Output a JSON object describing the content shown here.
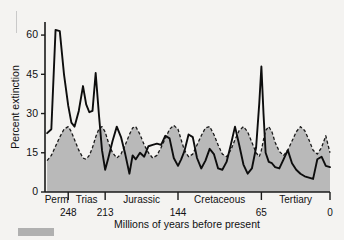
{
  "chart_data": {
    "type": "line",
    "title": "",
    "xlabel": "Millions of years before present",
    "ylabel": "Percent extinction",
    "xlim": [
      270,
      0
    ],
    "ylim": [
      0,
      65
    ],
    "yticks": [
      0,
      15,
      30,
      45,
      60
    ],
    "ytick_labels": [
      "0",
      "15",
      "30",
      "45",
      "60"
    ],
    "x_axis_direction": "reversed",
    "grid": false,
    "legend": "none",
    "period_boundaries": [
      248,
      213,
      144,
      65,
      0
    ],
    "boundary_labels": [
      "248",
      "213",
      "144",
      "65",
      "0"
    ],
    "periods": [
      {
        "label": "Perm",
        "start": 270,
        "end": 248
      },
      {
        "label": "Trias",
        "start": 248,
        "end": 213
      },
      {
        "label": "Jurassic",
        "start": 213,
        "end": 144
      },
      {
        "label": "Cretaceous",
        "start": 144,
        "end": 65
      },
      {
        "label": "Tertiary",
        "start": 65,
        "end": 0
      }
    ],
    "series": [
      {
        "name": "Observed percent extinction",
        "style": "solid",
        "color": "#0d0d0d",
        "points": [
          [
            268,
            22.5
          ],
          [
            264,
            24.0
          ],
          [
            260,
            62.0
          ],
          [
            256,
            61.5
          ],
          [
            252,
            45.0
          ],
          [
            248,
            33.0
          ],
          [
            245,
            26.5
          ],
          [
            242,
            25.0
          ],
          [
            238,
            31.0
          ],
          [
            234,
            40.5
          ],
          [
            231,
            33.5
          ],
          [
            228,
            30.5
          ],
          [
            225,
            31.0
          ],
          [
            222,
            45.5
          ],
          [
            219,
            30.0
          ],
          [
            216,
            16.0
          ],
          [
            213,
            8.5
          ],
          [
            210,
            13.0
          ],
          [
            206,
            19.5
          ],
          [
            202,
            25.0
          ],
          [
            198,
            21.0
          ],
          [
            194,
            14.5
          ],
          [
            190,
            7.0
          ],
          [
            187,
            14.0
          ],
          [
            184,
            12.5
          ],
          [
            180,
            15.0
          ],
          [
            176,
            13.5
          ],
          [
            172,
            17.5
          ],
          [
            168,
            18.0
          ],
          [
            164,
            18.5
          ],
          [
            160,
            18.0
          ],
          [
            156,
            21.5
          ],
          [
            152,
            20.5
          ],
          [
            148,
            13.0
          ],
          [
            144,
            10.0
          ],
          [
            141,
            12.5
          ],
          [
            138,
            15.5
          ],
          [
            134,
            22.0
          ],
          [
            130,
            21.0
          ],
          [
            126,
            13.0
          ],
          [
            122,
            9.0
          ],
          [
            118,
            12.0
          ],
          [
            114,
            16.5
          ],
          [
            110,
            14.5
          ],
          [
            106,
            9.0
          ],
          [
            102,
            8.5
          ],
          [
            98,
            11.5
          ],
          [
            94,
            18.0
          ],
          [
            90,
            25.0
          ],
          [
            86,
            18.0
          ],
          [
            82,
            10.5
          ],
          [
            78,
            7.0
          ],
          [
            74,
            9.0
          ],
          [
            70,
            17.0
          ],
          [
            67,
            34.0
          ],
          [
            65,
            48.0
          ],
          [
            63,
            30.0
          ],
          [
            61,
            15.0
          ],
          [
            58,
            11.5
          ],
          [
            55,
            11.0
          ],
          [
            52,
            9.5
          ],
          [
            48,
            9.0
          ],
          [
            44,
            12.5
          ],
          [
            40,
            16.0
          ],
          [
            36,
            11.0
          ],
          [
            32,
            8.5
          ],
          [
            28,
            7.0
          ],
          [
            24,
            6.0
          ],
          [
            20,
            5.5
          ],
          [
            16,
            5.0
          ],
          [
            12,
            12.5
          ],
          [
            8,
            13.5
          ],
          [
            4,
            10.0
          ],
          [
            0,
            9.5
          ]
        ]
      },
      {
        "name": "Background extinction trend",
        "style": "dashed-filled",
        "color": "#1a1a1a",
        "fill": "#b9b9b9",
        "points": [
          [
            268,
            12.0
          ],
          [
            264,
            14.0
          ],
          [
            260,
            17.5
          ],
          [
            256,
            21.0
          ],
          [
            252,
            24.0
          ],
          [
            248,
            25.0
          ],
          [
            245,
            23.0
          ],
          [
            242,
            20.0
          ],
          [
            238,
            16.0
          ],
          [
            234,
            13.0
          ],
          [
            231,
            12.5
          ],
          [
            228,
            14.0
          ],
          [
            225,
            17.0
          ],
          [
            222,
            21.0
          ],
          [
            219,
            24.0
          ],
          [
            216,
            25.0
          ],
          [
            213,
            23.0
          ],
          [
            210,
            19.0
          ],
          [
            206,
            15.0
          ],
          [
            202,
            13.0
          ],
          [
            198,
            14.5
          ],
          [
            194,
            18.0
          ],
          [
            190,
            22.0
          ],
          [
            187,
            24.5
          ],
          [
            184,
            25.0
          ],
          [
            180,
            22.0
          ],
          [
            176,
            18.0
          ],
          [
            172,
            15.0
          ],
          [
            168,
            13.0
          ],
          [
            164,
            14.0
          ],
          [
            160,
            17.0
          ],
          [
            156,
            20.5
          ],
          [
            152,
            24.0
          ],
          [
            148,
            25.5
          ],
          [
            144,
            24.0
          ],
          [
            141,
            20.0
          ],
          [
            138,
            16.0
          ],
          [
            134,
            13.5
          ],
          [
            130,
            14.5
          ],
          [
            126,
            18.0
          ],
          [
            122,
            21.5
          ],
          [
            118,
            24.5
          ],
          [
            114,
            25.0
          ],
          [
            110,
            22.0
          ],
          [
            106,
            18.0
          ],
          [
            102,
            14.5
          ],
          [
            98,
            13.5
          ],
          [
            94,
            16.0
          ],
          [
            90,
            20.0
          ],
          [
            86,
            23.5
          ],
          [
            82,
            25.0
          ],
          [
            78,
            23.0
          ],
          [
            74,
            19.0
          ],
          [
            70,
            15.0
          ],
          [
            67,
            13.5
          ],
          [
            65,
            16.0
          ],
          [
            63,
            20.0
          ],
          [
            61,
            23.5
          ],
          [
            58,
            25.0
          ],
          [
            55,
            23.0
          ],
          [
            52,
            19.0
          ],
          [
            48,
            15.5
          ],
          [
            44,
            14.0
          ],
          [
            40,
            16.0
          ],
          [
            36,
            19.5
          ],
          [
            32,
            23.0
          ],
          [
            28,
            25.0
          ],
          [
            24,
            23.5
          ],
          [
            20,
            20.0
          ],
          [
            16,
            16.0
          ],
          [
            12,
            14.5
          ],
          [
            8,
            17.0
          ],
          [
            4,
            21.5
          ],
          [
            0,
            15.0
          ]
        ]
      }
    ]
  },
  "plot_geometry": {
    "left": 45,
    "right": 330,
    "top": 22,
    "bottom": 192
  }
}
